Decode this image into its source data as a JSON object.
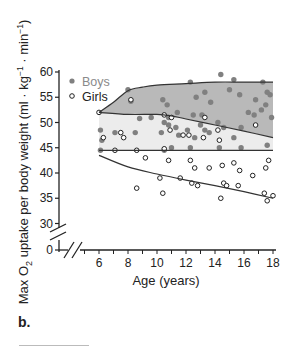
{
  "panel_label": "b.",
  "chart_data": {
    "type": "scatter",
    "title": "",
    "xlabel": "Age (years)",
    "ylabel": "Max O₂ uptake per body weight (ml · kg⁻¹ · min⁻¹)",
    "xlim": [
      6,
      18
    ],
    "ylim": [
      30,
      60
    ],
    "y_axis_break": true,
    "x_axis_break": true,
    "x_ticks": [
      6,
      8,
      10,
      12,
      14,
      16,
      18
    ],
    "y_ticks": [
      0,
      30,
      35,
      40,
      45,
      50,
      55,
      60
    ],
    "grid": false,
    "legend_position": "top-left",
    "colors": {
      "boys_fill": "#808080",
      "boys_band": "#b9b9b9",
      "girls_band": "#ececec",
      "line": "#333333"
    },
    "series": [
      {
        "name": "Boys",
        "marker": "filled-circle",
        "points": [
          [
            8.0,
            56.5
          ],
          [
            8.2,
            54.2
          ],
          [
            8.8,
            50.8
          ],
          [
            9.6,
            51
          ],
          [
            10.4,
            54.5
          ],
          [
            10.7,
            53.5
          ],
          [
            10.8,
            51
          ],
          [
            11.4,
            52
          ],
          [
            12.3,
            58
          ],
          [
            12.7,
            55
          ],
          [
            13.3,
            56
          ],
          [
            13.7,
            54
          ],
          [
            14.4,
            59.5
          ],
          [
            15,
            56.5
          ],
          [
            15.3,
            58.5
          ],
          [
            15.7,
            55.5
          ],
          [
            16.8,
            54.5
          ],
          [
            17.3,
            58
          ],
          [
            17.6,
            56
          ],
          [
            17.8,
            55.5
          ],
          [
            17.5,
            53.5
          ],
          [
            17.2,
            52.5
          ],
          [
            16.7,
            51.5
          ],
          [
            16.3,
            52
          ],
          [
            17.9,
            51
          ],
          [
            6.1,
            48.5
          ],
          [
            6.2,
            46.5
          ],
          [
            7.1,
            48
          ],
          [
            8.5,
            48
          ],
          [
            10.3,
            48
          ],
          [
            10.5,
            50
          ],
          [
            10.8,
            49.5
          ],
          [
            11.3,
            49
          ],
          [
            11.5,
            47.5
          ],
          [
            12.1,
            48.5
          ],
          [
            12.6,
            47
          ],
          [
            13,
            49.5
          ],
          [
            13.3,
            48.5
          ],
          [
            13.6,
            48
          ],
          [
            14.2,
            50
          ],
          [
            14.6,
            49
          ],
          [
            15.3,
            47
          ],
          [
            15.8,
            49
          ],
          [
            12.5,
            51.5
          ],
          [
            13.1,
            51.5
          ],
          [
            11,
            45
          ],
          [
            12.3,
            45
          ],
          [
            14.3,
            45
          ],
          [
            15.8,
            45
          ],
          [
            17.6,
            45.5
          ],
          [
            6.1,
            44.5
          ],
          [
            10.5,
            44.5
          ]
        ]
      },
      {
        "name": "Girls",
        "marker": "open-circle",
        "points": [
          [
            6,
            52
          ],
          [
            8.2,
            54.5
          ],
          [
            10.5,
            51.5
          ],
          [
            11,
            51
          ],
          [
            13.3,
            51
          ],
          [
            6.3,
            47
          ],
          [
            7.5,
            48
          ],
          [
            7.7,
            47
          ],
          [
            10.9,
            48.5
          ],
          [
            11.8,
            47.5
          ],
          [
            12.2,
            47.5
          ],
          [
            14.2,
            48.5
          ],
          [
            14.3,
            46.5
          ],
          [
            16.8,
            49.5
          ],
          [
            13.2,
            47
          ],
          [
            7.1,
            44.5
          ],
          [
            8.6,
            44.5
          ],
          [
            10.5,
            44.8
          ],
          [
            9.2,
            43
          ],
          [
            10.8,
            42.5
          ],
          [
            12.3,
            42.5
          ],
          [
            12.6,
            41
          ],
          [
            13.6,
            41
          ],
          [
            14.5,
            41.5
          ],
          [
            15.3,
            42
          ],
          [
            15.7,
            40.5
          ],
          [
            16.6,
            39.5
          ],
          [
            17.5,
            41
          ],
          [
            17.7,
            42.5
          ],
          [
            12.4,
            38
          ],
          [
            12.8,
            37.5
          ],
          [
            14.6,
            38
          ],
          [
            14.8,
            37.5
          ],
          [
            15.6,
            37.5
          ],
          [
            17.4,
            36
          ],
          [
            17.6,
            34.5
          ],
          [
            18,
            35.5
          ],
          [
            14.4,
            35
          ],
          [
            11.6,
            39
          ],
          [
            10.2,
            39
          ],
          [
            8.6,
            37
          ],
          [
            10.4,
            36
          ]
        ]
      }
    ],
    "bands": [
      {
        "name": "Boys range (upper)",
        "upper": [
          [
            6,
            52
          ],
          [
            7,
            54
          ],
          [
            8,
            56.3
          ],
          [
            9,
            57
          ],
          [
            10,
            57.4
          ],
          [
            12,
            57.7
          ],
          [
            14,
            58
          ],
          [
            16,
            58
          ],
          [
            18,
            58
          ]
        ],
        "lower": [
          [
            6,
            52
          ],
          [
            8,
            51.6
          ],
          [
            10,
            51.6
          ],
          [
            11,
            51.3
          ],
          [
            12,
            50.7
          ],
          [
            14,
            49.5
          ],
          [
            16,
            48.3
          ],
          [
            18,
            47
          ]
        ]
      },
      {
        "name": "Overlap range",
        "upper": [
          [
            6,
            52
          ],
          [
            8,
            51.6
          ],
          [
            10,
            51.6
          ],
          [
            11,
            51.3
          ],
          [
            12,
            50.7
          ],
          [
            14,
            49.5
          ],
          [
            16,
            48.3
          ],
          [
            18,
            47
          ]
        ],
        "lower": [
          [
            6,
            44.5
          ],
          [
            18,
            44.5
          ]
        ]
      }
    ],
    "curves": [
      {
        "name": "Girls lower bound",
        "points": [
          [
            6,
            43.5
          ],
          [
            8,
            41.2
          ],
          [
            10,
            39.8
          ],
          [
            12,
            38.6
          ],
          [
            14,
            37.5
          ],
          [
            16,
            36.3
          ],
          [
            18,
            35
          ]
        ]
      }
    ]
  },
  "legend": {
    "boys": "Boys",
    "girls": "Girls"
  },
  "axis": {
    "xlabel": "Age (years)",
    "ylabel_main": "Max O",
    "ylabel_sub": "2",
    "ylabel_rest": " uptake per body weight (ml · kg",
    "ylabel_sup1": "−1",
    "ylabel_mid": " · min",
    "ylabel_sup2": "−1",
    "ylabel_end": ")",
    "y_tick_labels": [
      "60",
      "55",
      "50",
      "45",
      "40",
      "35",
      "30",
      "0"
    ],
    "x_tick_labels": [
      "6",
      "8",
      "10",
      "12",
      "14",
      "16",
      "18"
    ]
  }
}
